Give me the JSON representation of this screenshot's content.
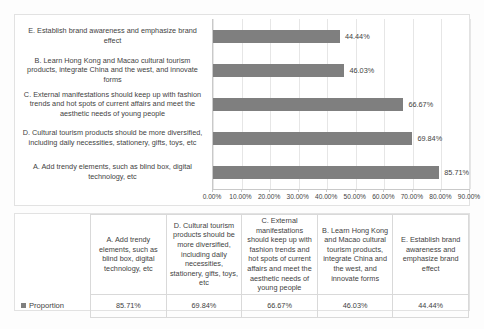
{
  "chart_data": {
    "type": "bar",
    "orientation": "horizontal",
    "title": "",
    "xlabel": "",
    "ylabel": "",
    "xlim": [
      0,
      0.9
    ],
    "xticks": [
      "0.00%",
      "10.00%",
      "20.00%",
      "30.00%",
      "40.00%",
      "50.00%",
      "60.00%",
      "70.00%",
      "80.00%",
      "90.00%"
    ],
    "xtick_values": [
      0,
      10,
      20,
      30,
      40,
      50,
      60,
      70,
      80,
      90
    ],
    "grid": true,
    "legend": [
      "Proportion"
    ],
    "legend_position": "table-row",
    "series_color": "#7f7f7f",
    "categories": [
      "E. Establish brand awareness and emphasize brand effect",
      "B. Learn Hong Kong and Macao cultural tourism products, integrate China and the west, and innovate forms",
      "C. External manifestations should keep up with fashion trends and hot spots of current affairs and meet the aesthetic needs of young people",
      "D. Cultural tourism products should be more diversified, including daily necessities, stationery, gifts, toys, etc",
      "A. Add trendy elements, such as blind box, digital technology, etc"
    ],
    "values": [
      44.44,
      46.03,
      66.67,
      69.84,
      85.71
    ],
    "value_labels": [
      "44.44%",
      "46.03%",
      "66.67%",
      "69.84%",
      "85.71%"
    ]
  },
  "table": {
    "legend_label": "Proportion",
    "columns": [
      "A. Add trendy elements, such as blind box, digital technology, etc",
      "D. Cultural tourism products should be more diversified, including daily necessities, stationery, gifts, toys, etc",
      "C. External manifestations should keep up with fashion trends and hot spots of current affairs and meet the aesthetic needs of young people",
      "B. Learn Hong Kong and Macao cultural tourism products, integrate China and the west, and innovate forms",
      "E. Establish brand awareness and emphasize brand effect"
    ],
    "values": [
      "85.71%",
      "69.84%",
      "66.67%",
      "46.03%",
      "44.44%"
    ]
  }
}
